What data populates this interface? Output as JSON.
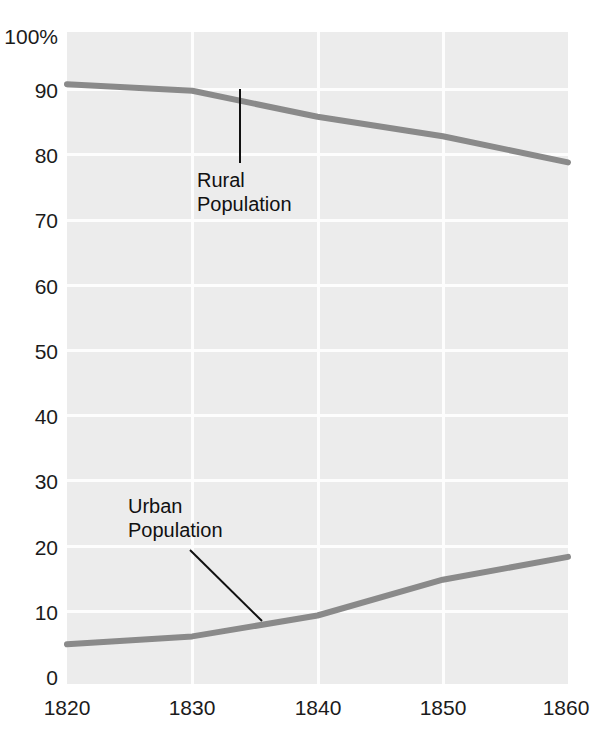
{
  "chart_data": {
    "type": "line",
    "title": "",
    "subtitle": "",
    "xlabel": "",
    "ylabel": "",
    "x": [
      1820,
      1830,
      1840,
      1850,
      1860
    ],
    "xlim": [
      1820,
      1860
    ],
    "ylim": [
      0,
      100
    ],
    "grid": true,
    "legend_position": "inline-annotations",
    "x_tick_labels": [
      "1820",
      "1830",
      "1840",
      "1850",
      "1860"
    ],
    "y_tick_labels": [
      "0",
      "10",
      "20",
      "30",
      "40",
      "50",
      "60",
      "70",
      "80",
      "90",
      "100%"
    ],
    "y_tick_values": [
      0,
      10,
      20,
      30,
      40,
      50,
      60,
      70,
      80,
      90,
      100
    ],
    "series": [
      {
        "name": "Rural Population",
        "values": [
          92,
          91,
          87,
          84,
          80
        ],
        "color": "#8a8a8a"
      },
      {
        "name": "Urban Population",
        "values": [
          6.1,
          7.3,
          10.5,
          16,
          19.5
        ],
        "color": "#8a8a8a"
      }
    ],
    "annotations": [
      {
        "text": "Rural\nPopulation",
        "series": "Rural Population"
      },
      {
        "text": "Urban\nPopulation",
        "series": "Urban Population"
      }
    ],
    "colors": {
      "plot_background": "#ececec",
      "gridline": "#fdfdfd",
      "line": "#8a8a8a",
      "text": "#1b1b1b",
      "leader_line": "#111111",
      "page_background": "#ffffff"
    }
  },
  "axis": {
    "y_ticks": [
      {
        "label": "100%"
      },
      {
        "label": "90"
      },
      {
        "label": "80"
      },
      {
        "label": "70"
      },
      {
        "label": "60"
      },
      {
        "label": "50"
      },
      {
        "label": "40"
      },
      {
        "label": "30"
      },
      {
        "label": "20"
      },
      {
        "label": "10"
      },
      {
        "label": "0"
      }
    ],
    "x_ticks": [
      {
        "label": "1820"
      },
      {
        "label": "1830"
      },
      {
        "label": "1840"
      },
      {
        "label": "1850"
      },
      {
        "label": "1860"
      }
    ]
  },
  "annotations": {
    "rural": "Rural\nPopulation",
    "urban": "Urban\nPopulation"
  }
}
